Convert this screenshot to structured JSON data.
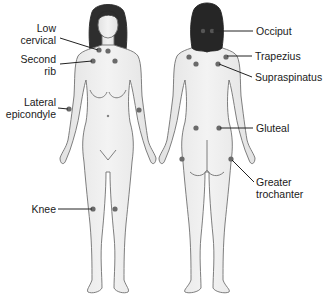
{
  "figure": {
    "views": [
      "anterior",
      "posterior"
    ],
    "dot_color": "#6a6a6a",
    "skin_color": "#ececec",
    "outline_color": "#6e6e6e",
    "hair_color": "#2a2a2a"
  },
  "labels": {
    "low_cervical": {
      "line1": "Low",
      "line2": "cervical"
    },
    "second_rib": {
      "line1": "Second",
      "line2": "rib"
    },
    "lateral_epicondyle": {
      "line1": "Lateral",
      "line2": "epicondyle"
    },
    "knee": "Knee",
    "occiput": "Occiput",
    "trapezius": "Trapezius",
    "supraspinatus": "Supraspinatus",
    "gluteal": "Gluteal",
    "greater_trochanter": {
      "line1": "Greater",
      "line2": "trochanter"
    }
  }
}
